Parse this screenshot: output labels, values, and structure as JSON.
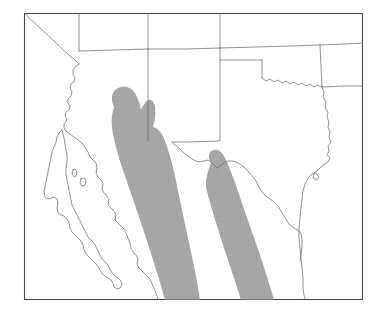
{
  "figure": {
    "type": "distribution-range-map",
    "title": "",
    "caption": "",
    "region_description": "Southwestern United States and northern Mexico",
    "frame": {
      "x": 24,
      "y": 13,
      "width": 339,
      "height": 287,
      "border_color": "#4a4a4a"
    },
    "colors": {
      "background": "#ffffff",
      "range_shading": "#a9a9a9",
      "boundary_line": "#6e6e6e",
      "frame_line": "#4a4a4a"
    }
  },
  "legend": {
    "visible": false,
    "entries": [
      {
        "label": "",
        "swatch_color": "#a9a9a9"
      }
    ]
  },
  "map_features": {
    "political_boundaries_shown": true,
    "coastlines_shown": true,
    "labels_shown": false,
    "graticule_shown": false
  },
  "range_bands": [
    {
      "name": "western-range-band",
      "description": "Broad shaded band extending from southeastern Arizona and southwestern New Mexico southeast through Sonora and Chihuahua to the lower map edge",
      "fill": "#a9a9a9"
    },
    {
      "name": "eastern-range-band",
      "description": "Narrow shaded band extending from the Big Bend region of the Rio Grande southeast through Coahuila to the lower map edge",
      "fill": "#a9a9a9"
    }
  ]
}
